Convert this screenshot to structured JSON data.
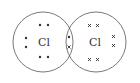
{
  "diagram": {
    "type": "dot-and-cross",
    "molecule": "Cl2",
    "atoms": [
      {
        "symbol": "Cl",
        "electron_marker": "dot"
      },
      {
        "symbol": "Cl",
        "electron_marker": "cross"
      }
    ],
    "colors": {
      "stroke": "#555555",
      "marker": "#333333",
      "background": "#ffffff"
    }
  }
}
